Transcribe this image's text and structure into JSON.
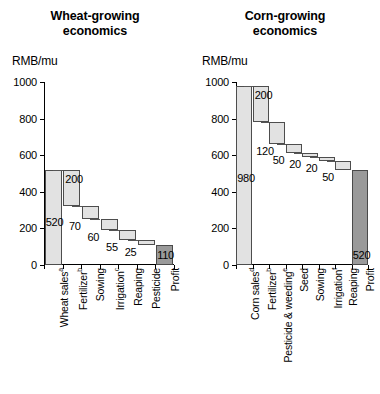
{
  "chart_data": [
    {
      "type": "bar",
      "subtype": "waterfall",
      "title": "Wheat-growing economics",
      "title_lines": [
        "Wheat-growing",
        "economics"
      ],
      "ylabel": "RMB/mu",
      "xlabel": "",
      "ylim": [
        0,
        1000
      ],
      "yticks": [
        0,
        200,
        400,
        600,
        800,
        1000
      ],
      "ytick_labels": [
        "0",
        "200",
        "400",
        "600",
        "800",
        "1000"
      ],
      "grid": false,
      "legend": "none",
      "categories": [
        "Wheat sales",
        "Fertilizer",
        "Sowing",
        "Irrigation",
        "Reaping",
        "Pesticide",
        "Profit"
      ],
      "category_footnotes": [
        "a",
        "b",
        "",
        "c",
        "",
        "",
        ""
      ],
      "values": [
        520,
        200,
        70,
        60,
        55,
        25,
        110
      ],
      "value_labels": [
        "520",
        "200",
        "70",
        "60",
        "55",
        "25",
        "110"
      ],
      "kinds": [
        "total",
        "cost",
        "cost",
        "cost",
        "cost",
        "cost",
        "profit"
      ],
      "bar_bases": [
        0,
        320,
        250,
        190,
        135,
        110,
        0
      ],
      "bar_tops": [
        520,
        520,
        320,
        250,
        190,
        135,
        110
      ]
    },
    {
      "type": "bar",
      "subtype": "waterfall",
      "title": "Corn-growing economics",
      "title_lines": [
        "Corn-growing",
        "economics"
      ],
      "ylabel": "RMB/mu",
      "xlabel": "",
      "ylim": [
        0,
        1000
      ],
      "yticks": [
        0,
        200,
        400,
        600,
        800,
        1000
      ],
      "ytick_labels": [
        "0",
        "200",
        "400",
        "600",
        "800",
        "1000"
      ],
      "grid": false,
      "legend": "none",
      "categories": [
        "Corn sales",
        "Fertilizer",
        "Pesticide & weeding",
        "Seed",
        "Sowing",
        "Irrigation",
        "Reaping",
        "Profit"
      ],
      "category_footnotes": [
        "d",
        "b",
        "e",
        "",
        "",
        "f",
        "",
        ""
      ],
      "values": [
        980,
        200,
        120,
        50,
        20,
        20,
        50,
        520
      ],
      "value_labels": [
        "980",
        "200",
        "120",
        "50",
        "20",
        "20",
        "50",
        "520"
      ],
      "kinds": [
        "total",
        "cost",
        "cost",
        "cost",
        "cost",
        "cost",
        "cost",
        "profit"
      ],
      "bar_bases": [
        0,
        780,
        660,
        610,
        590,
        570,
        520,
        0
      ],
      "bar_tops": [
        980,
        980,
        780,
        660,
        610,
        590,
        570,
        520
      ]
    }
  ],
  "colors": {
    "total_fill": "#e2e2e2",
    "cost_fill": "#e2e2e2",
    "profit_fill": "#9a9a9a",
    "bar_stroke": "#4d4d4d",
    "axis": "#000000",
    "text": "#000000",
    "background": "#ffffff"
  }
}
